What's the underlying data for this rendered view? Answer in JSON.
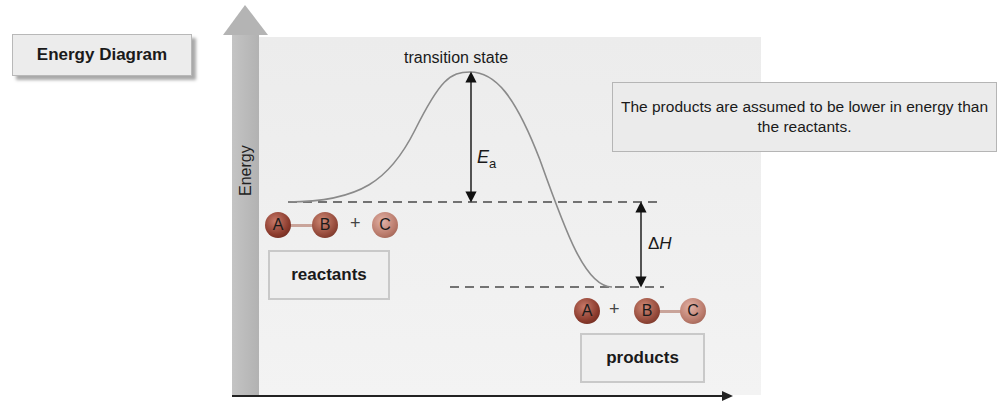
{
  "title": "Energy Diagram",
  "note": "The products are assumed to be lower in energy than the reactants.",
  "axis": {
    "y_label": "Energy",
    "x_label": ""
  },
  "curve": {
    "transition_state_label": "transition state",
    "activation_energy_symbol": "E",
    "activation_energy_subscript": "a",
    "enthalpy_delta_symbol": "Δ",
    "enthalpy_symbol": "H"
  },
  "reactants": {
    "label": "reactants",
    "molecules": [
      {
        "atoms": [
          "A",
          "B"
        ],
        "bonded": true
      },
      {
        "atoms": [
          "C"
        ],
        "bonded": false
      }
    ],
    "plus": "+"
  },
  "products": {
    "label": "products",
    "molecules": [
      {
        "atoms": [
          "A"
        ],
        "bonded": false
      },
      {
        "atoms": [
          "B",
          "C"
        ],
        "bonded": true
      }
    ],
    "plus": "+"
  },
  "atoms": {
    "a": "A",
    "b": "B",
    "c": "C"
  },
  "colors": {
    "curve": "#8a8a8a",
    "axis_arrow": "#b0b0b0",
    "panel": "#eeeeee",
    "atom_dark": "#8a3a2c",
    "atom_light": "#b97a6b"
  }
}
